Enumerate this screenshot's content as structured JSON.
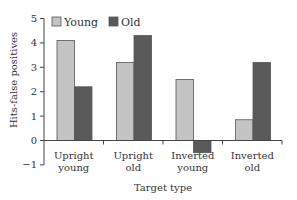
{
  "chart_data": {
    "type": "bar",
    "title": "",
    "xlabel": "Target type",
    "ylabel": "Hits-false positives",
    "ylim": [
      -1,
      5
    ],
    "yticks": [
      -1,
      0,
      1,
      2,
      3,
      4,
      5
    ],
    "grid": false,
    "legend_position": "top-left inside",
    "categories": [
      [
        "Upright",
        "young"
      ],
      [
        "Upright",
        "old"
      ],
      [
        "Inverted",
        "young"
      ],
      [
        "Inverted",
        "old"
      ]
    ],
    "series": [
      {
        "name": "Young",
        "color": "#c4c4c4",
        "values": [
          4.1,
          3.2,
          2.5,
          0.85
        ]
      },
      {
        "name": "Old",
        "color": "#5a5a5a",
        "values": [
          2.2,
          4.3,
          -0.5,
          3.2
        ]
      }
    ]
  }
}
